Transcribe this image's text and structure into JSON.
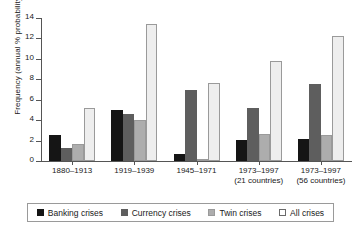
{
  "chart_data": {
    "type": "bar",
    "title": "",
    "xlabel": "",
    "ylabel": "Frequency (annual % probability)",
    "ylim": [
      0,
      14
    ],
    "yticks": [
      0,
      2,
      4,
      6,
      8,
      10,
      12,
      14
    ],
    "ytick_labels": [
      "0",
      "2",
      "4",
      "6",
      "8",
      "10",
      "12",
      "14"
    ],
    "grid": false,
    "legend_position": "bottom",
    "categories": [
      "1880–1913",
      "1919–1939",
      "1945–1971",
      "1973–1997",
      "1973–1997"
    ],
    "category_sublabels": [
      "",
      "",
      "",
      "(21 countries)",
      "(56 countries)"
    ],
    "series": [
      {
        "name": "Banking crises",
        "color": "#151515",
        "values": [
          2.5,
          5.0,
          0.7,
          2.1,
          2.2
        ]
      },
      {
        "name": "Currency crises",
        "color": "#5e5e5e",
        "values": [
          1.3,
          4.6,
          7.0,
          5.2,
          7.5
        ]
      },
      {
        "name": "Twin crises",
        "color": "#adadad",
        "values": [
          1.7,
          4.0,
          0.2,
          2.6,
          2.5
        ]
      },
      {
        "name": "All crises",
        "color": "#eeeeee",
        "values": [
          5.2,
          13.4,
          7.6,
          9.8,
          12.2
        ]
      }
    ]
  }
}
